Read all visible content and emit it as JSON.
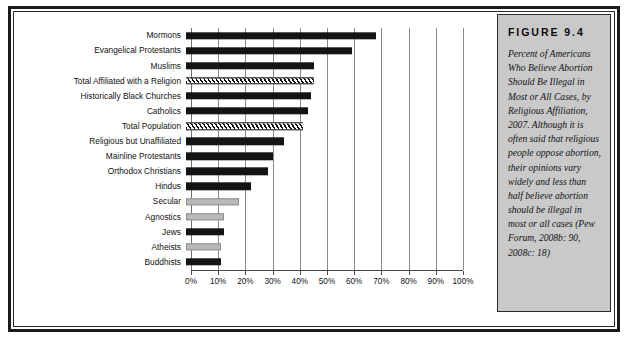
{
  "figure": {
    "number_label": "FIGURE 9.4",
    "caption": "Percent of Americans Who Believe Abortion Should Be Illegal in Most or All Cases, by Religious Affiliation, 2007. Although it is often said that religious people oppose abortion, their opinions vary widely and less than half believe abortion should be illegal in most or all cases (Pew Forum, 2008b: 90, 2008c: 18)"
  },
  "colors": {
    "bar_dark": "#141414",
    "bar_gray": "#b9b9b9",
    "hatch_line": "#111111",
    "gridline": "#8a8a8a",
    "caption_background": "#c9c9c9",
    "frame": "#1b1b1b"
  },
  "chart_data": {
    "type": "bar",
    "orientation": "horizontal",
    "title": "Percent of Americans Who Believe Abortion Should Be Illegal in Most or All Cases, by Religious Affiliation, 2007",
    "xlabel": "",
    "ylabel": "",
    "xlim": [
      0,
      100
    ],
    "grid": true,
    "legend": "none",
    "xticks": [
      "0%",
      "10%",
      "20%",
      "30%",
      "40%",
      "50%",
      "60%",
      "70%",
      "80%",
      "90%",
      "100%"
    ],
    "xtick_values": [
      0,
      10,
      20,
      30,
      40,
      50,
      60,
      70,
      80,
      90,
      100
    ],
    "categories": [
      "Mormons",
      "Evangelical Protestants",
      "Muslims",
      "Total Affiliated with a Religion",
      "Historically Black Churches",
      "Catholics",
      "Total Population",
      "Religious but Unaffiliated",
      "Mainline Protestants",
      "Orthodox Christians",
      "Hindus",
      "Secular",
      "Agnostics",
      "Jews",
      "Atheists",
      "Buddhists"
    ],
    "values": [
      70,
      61,
      47,
      47,
      46,
      45,
      43,
      36,
      32,
      30,
      24,
      19.5,
      14,
      14,
      13,
      13
    ],
    "bar_styles": [
      "solid-dark",
      "solid-dark",
      "solid-dark",
      "hatched",
      "solid-dark",
      "solid-dark",
      "hatched",
      "solid-dark",
      "solid-dark",
      "solid-dark",
      "solid-dark",
      "solid-gray",
      "solid-gray",
      "solid-dark",
      "solid-gray",
      "solid-dark"
    ]
  }
}
